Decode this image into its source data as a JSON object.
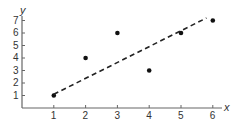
{
  "chart_data": {
    "type": "scatter",
    "title": "",
    "xlabel": "x",
    "ylabel": "y",
    "xlim": [
      0,
      6.5
    ],
    "ylim": [
      0,
      7.3
    ],
    "xticks": [
      1,
      2,
      3,
      4,
      5,
      6
    ],
    "yticks": [
      1,
      2,
      3,
      4,
      5,
      6,
      7
    ],
    "grid": false,
    "legend": null,
    "series": [
      {
        "name": "data points",
        "type": "scatter",
        "points": [
          {
            "x": 1,
            "y": 1
          },
          {
            "x": 2,
            "y": 4
          },
          {
            "x": 3,
            "y": 6
          },
          {
            "x": 4,
            "y": 3
          },
          {
            "x": 5,
            "y": 6
          },
          {
            "x": 6,
            "y": 7
          }
        ]
      },
      {
        "name": "trend line",
        "type": "line",
        "style": "dashed",
        "points": [
          {
            "x": 1,
            "y": 1.1
          },
          {
            "x": 5.8,
            "y": 7.2
          }
        ]
      }
    ]
  },
  "colors": {
    "axis": "#666666",
    "points": "#111111",
    "trend": "#222222",
    "text": "#333333"
  }
}
